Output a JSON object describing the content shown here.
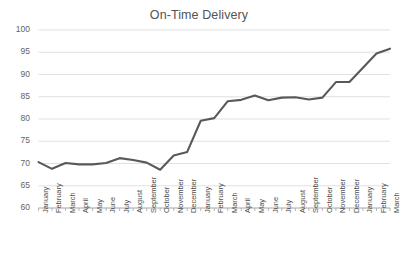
{
  "chart_data": {
    "type": "line",
    "title": "On-Time Delivery",
    "xlabel": "",
    "ylabel": "",
    "ylim": [
      60,
      100
    ],
    "ytick_values": [
      60,
      65,
      70,
      75,
      80,
      85,
      90,
      95,
      100
    ],
    "ytick_labels": [
      "60",
      "65",
      "70",
      "75",
      "80",
      "85",
      "90",
      "95",
      "100"
    ],
    "grid": true,
    "grid_axis": "y",
    "legend": false,
    "legend_position": "none",
    "line_color": "#595959",
    "grid_color": "#d9d9d9",
    "axis_color": "#a6a6a6",
    "title_color": "#545454",
    "tick_label_color": "#595959",
    "background_color": "#ffffff",
    "categories": [
      "January",
      "February",
      "March",
      "April",
      "May",
      "June",
      "July",
      "August",
      "September",
      "October",
      "November",
      "December",
      "January",
      "February",
      "March",
      "April",
      "May",
      "June",
      "July",
      "August",
      "September",
      "October",
      "November",
      "December",
      "January",
      "February",
      "March"
    ],
    "values": [
      70.3,
      68.8,
      70.1,
      69.8,
      69.8,
      70.1,
      71.2,
      70.8,
      70.2,
      68.6,
      71.8,
      72.6,
      79.6,
      80.2,
      84.0,
      84.3,
      85.3,
      84.2,
      84.8,
      84.9,
      84.4,
      84.8,
      88.3,
      88.3,
      91.5,
      94.7,
      95.8
    ],
    "series": [
      {
        "name": "On-Time Delivery",
        "values": [
          70.3,
          68.8,
          70.1,
          69.8,
          69.8,
          70.1,
          71.2,
          70.8,
          70.2,
          68.6,
          71.8,
          72.6,
          79.6,
          80.2,
          84.0,
          84.3,
          85.3,
          84.2,
          84.8,
          84.9,
          84.4,
          84.8,
          88.3,
          88.3,
          91.5,
          94.7,
          95.8
        ]
      }
    ]
  }
}
